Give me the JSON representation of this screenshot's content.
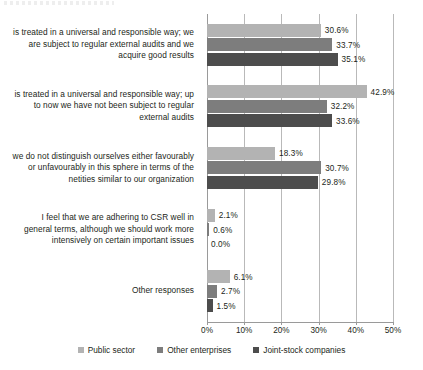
{
  "chart_data": {
    "type": "bar",
    "orientation": "horizontal",
    "title": "",
    "xlabel": "",
    "ylabel": "",
    "xlim": [
      0,
      50
    ],
    "xticks": [
      0,
      10,
      20,
      30,
      40,
      50
    ],
    "xtick_labels": [
      "0%",
      "10%",
      "20%",
      "30%",
      "40%",
      "50%"
    ],
    "grid": true,
    "legend_position": "bottom",
    "value_suffix": "%",
    "categories": [
      "is treated in a universal and responsible way; we are subject to regular external audits and we acquire good results",
      "is treated in a universal and responsible way; up to now we have not been subject to regular external audits",
      "we do not distinguish ourselves either favourably or unfavourably in this sphere in terms of the netities similar to our organization",
      "I feel that we are adhering to CSR well in general terms, although we should work more intensively on certain important issues",
      "Other responses"
    ],
    "series": [
      {
        "name": "Public sector",
        "color": "#b3b3b3",
        "values": [
          30.6,
          42.9,
          18.3,
          2.1,
          6.1
        ],
        "labels": [
          "30.6%",
          "42.9%",
          "18.3%",
          "2.1%",
          "6.1%"
        ]
      },
      {
        "name": "Other enterprises",
        "color": "#7d7d7d",
        "values": [
          33.7,
          32.2,
          30.7,
          0.6,
          2.7
        ],
        "labels": [
          "33.7%",
          "32.2%",
          "30.7%",
          "0.6%",
          "2.7%"
        ]
      },
      {
        "name": "Joint-stock companies",
        "color": "#4d4d4d",
        "values": [
          35.1,
          33.6,
          29.8,
          0.0,
          1.5
        ],
        "labels": [
          "35.1%",
          "33.6%",
          "29.8%",
          "0.0%",
          "1.5%"
        ]
      }
    ]
  }
}
